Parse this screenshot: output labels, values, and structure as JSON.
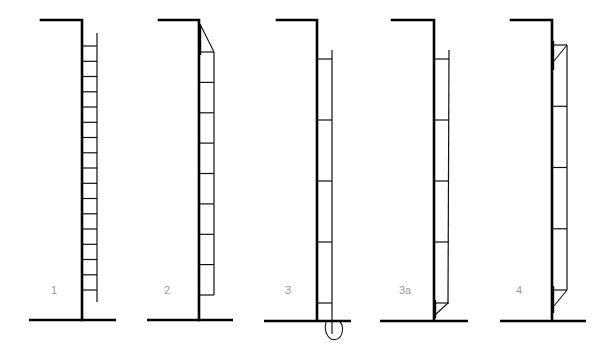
{
  "diagram": {
    "title": "",
    "panels": [
      {
        "id": "1",
        "label": "1",
        "description": "Ladder with many closely spaced rungs standing free beside wall",
        "rung_count": 17,
        "top_brace": false,
        "bottom_brace": false,
        "footing_blob": false
      },
      {
        "id": "2",
        "label": "2",
        "description": "Ladder with top bracket connecting to wall top",
        "rung_count": 9,
        "top_brace": true,
        "bottom_brace": false,
        "footing_blob": false
      },
      {
        "id": "3",
        "label": "3",
        "description": "Ladder with widely spaced rungs, rail anchored into a footing below ground",
        "rung_count": 5,
        "top_brace": false,
        "bottom_brace": false,
        "footing_blob": true
      },
      {
        "id": "3a",
        "label": "3a",
        "description": "Ladder with widely spaced rungs and bottom bracket to wall",
        "rung_count": 5,
        "top_brace": false,
        "bottom_brace": true,
        "footing_blob": false
      },
      {
        "id": "4",
        "label": "4",
        "description": "Ladder with top and bottom brackets fixed to wall",
        "rung_count": 5,
        "top_brace": true,
        "bottom_brace": true,
        "footing_blob": false
      }
    ]
  },
  "colors": {
    "line": "#000000",
    "label": "#9a9a9a",
    "background": "#ffffff"
  }
}
